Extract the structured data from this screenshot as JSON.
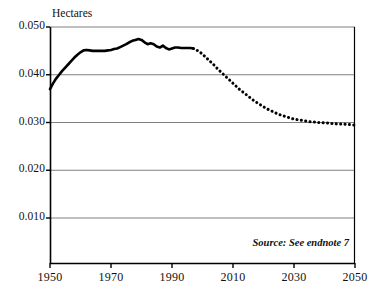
{
  "chart_data": {
    "type": "line",
    "title": "",
    "ylabel": "Hectares",
    "xlabel": "",
    "xlim": [
      1950,
      2050
    ],
    "ylim": [
      0,
      0.05
    ],
    "grid": true,
    "legend_position": "none",
    "ytick_labels": [
      "0.050",
      "0.040",
      "0.030",
      "0.020",
      "0.010"
    ],
    "ytick_values": [
      0.05,
      0.04,
      0.03,
      0.02,
      0.01
    ],
    "xtick_labels": [
      "1950",
      "1970",
      "1990",
      "2010",
      "2030",
      "2050"
    ],
    "xtick_values": [
      1950,
      1970,
      1990,
      2010,
      2030,
      2050
    ],
    "annotations": [
      {
        "name": "source",
        "text": "Source: See endnote 7"
      }
    ],
    "series": [
      {
        "name": "Grainland per person (historical)",
        "style": "solid",
        "x": [
          1950,
          1951,
          1952,
          1953,
          1954,
          1955,
          1956,
          1957,
          1958,
          1959,
          1960,
          1961,
          1962,
          1963,
          1964,
          1965,
          1966,
          1967,
          1968,
          1969,
          1970,
          1971,
          1972,
          1973,
          1974,
          1975,
          1976,
          1977,
          1978,
          1979,
          1980,
          1981,
          1982,
          1983,
          1984,
          1985,
          1986,
          1987,
          1988,
          1989,
          1990,
          1991,
          1992,
          1993,
          1994,
          1995,
          1996,
          1997
        ],
        "values": [
          0.037,
          0.0382,
          0.0392,
          0.04,
          0.0408,
          0.0415,
          0.0422,
          0.0429,
          0.0436,
          0.0442,
          0.0447,
          0.0451,
          0.0452,
          0.0451,
          0.045,
          0.045,
          0.045,
          0.045,
          0.045,
          0.0451,
          0.0452,
          0.0454,
          0.0455,
          0.0458,
          0.0461,
          0.0464,
          0.0468,
          0.0471,
          0.0473,
          0.0475,
          0.0473,
          0.0468,
          0.0464,
          0.0466,
          0.0464,
          0.0459,
          0.0457,
          0.0461,
          0.0456,
          0.0453,
          0.0455,
          0.0457,
          0.0457,
          0.0456,
          0.0456,
          0.0456,
          0.0456,
          0.0455
        ]
      },
      {
        "name": "Grainland per person (projected)",
        "style": "dotted",
        "x": [
          1997,
          1998,
          1999,
          2000,
          2001,
          2002,
          2003,
          2004,
          2005,
          2006,
          2007,
          2008,
          2009,
          2010,
          2011,
          2012,
          2013,
          2014,
          2015,
          2016,
          2017,
          2018,
          2019,
          2020,
          2021,
          2022,
          2023,
          2024,
          2025,
          2026,
          2027,
          2028,
          2029,
          2030,
          2031,
          2032,
          2033,
          2034,
          2035,
          2036,
          2037,
          2038,
          2039,
          2040,
          2041,
          2042,
          2043,
          2044,
          2045,
          2046,
          2047,
          2048,
          2049,
          2050
        ],
        "values": [
          0.0455,
          0.0452,
          0.0448,
          0.0443,
          0.0437,
          0.0431,
          0.0425,
          0.0419,
          0.0412,
          0.0406,
          0.04,
          0.0394,
          0.0388,
          0.0382,
          0.0376,
          0.037,
          0.0365,
          0.036,
          0.0355,
          0.035,
          0.0345,
          0.0341,
          0.0337,
          0.0333,
          0.0329,
          0.0326,
          0.0323,
          0.032,
          0.0317,
          0.0315,
          0.0313,
          0.0311,
          0.0309,
          0.0307,
          0.0306,
          0.0305,
          0.0304,
          0.0303,
          0.0302,
          0.0301,
          0.0301,
          0.03,
          0.03,
          0.0299,
          0.0299,
          0.0298,
          0.0298,
          0.0297,
          0.0297,
          0.0297,
          0.0296,
          0.0296,
          0.0295,
          0.0295
        ]
      }
    ],
    "colors": {
      "line": "#000000",
      "grid": "#808080",
      "axis": "#000000",
      "background": "#ffffff"
    }
  }
}
